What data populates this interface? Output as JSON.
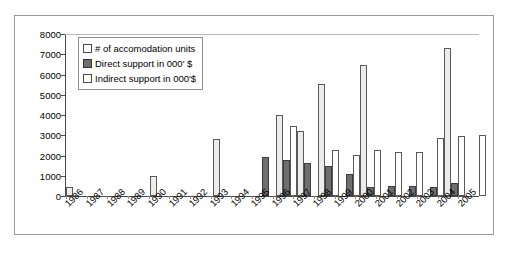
{
  "chart_data": {
    "type": "bar",
    "title": "",
    "xlabel": "",
    "ylabel": "",
    "ylim": [
      0,
      8000
    ],
    "yticks": [
      0,
      1000,
      2000,
      3000,
      4000,
      5000,
      6000,
      7000,
      8000
    ],
    "ytick_labels": [
      "0",
      "1000",
      "2000",
      "3000",
      "4000",
      "5000",
      "6000",
      "7000",
      "8000"
    ],
    "grid": "horizontal-top-only",
    "legend_position": "top-left-inside",
    "categories": [
      "1986",
      "1987",
      "1988",
      "1989",
      "1990",
      "1991",
      "1992",
      "1993",
      "1994",
      "1995",
      "1996",
      "1997",
      "1998",
      "1999",
      "2000",
      "2001",
      "2002",
      "2003",
      "2004",
      "2005"
    ],
    "series": [
      {
        "name": "# of accomodation units",
        "color": "#ECECEC",
        "values": [
          450,
          0,
          0,
          0,
          1000,
          0,
          0,
          2800,
          0,
          0,
          4000,
          3200,
          5550,
          0,
          6450,
          0,
          0,
          0,
          7300,
          0
        ]
      },
      {
        "name": "Direct support in 000' $",
        "color": "#6E6E6E",
        "values": [
          0,
          0,
          0,
          0,
          0,
          0,
          0,
          0,
          0,
          1950,
          1800,
          1650,
          1500,
          1100,
          450,
          500,
          500,
          430,
          650,
          0
        ]
      },
      {
        "name": "Indirect support in 000'$",
        "color": "#FFFFFF",
        "values": [
          0,
          0,
          0,
          0,
          0,
          0,
          0,
          0,
          0,
          0,
          3450,
          0,
          2250,
          2050,
          2250,
          2150,
          2150,
          2850,
          2950,
          3000
        ]
      }
    ]
  },
  "legend": {
    "items": [
      {
        "label": "# of accomodation units",
        "swatch": "s0"
      },
      {
        "label": "Direct support in 000' $",
        "swatch": "s1"
      },
      {
        "label": "Indirect support in 000'$",
        "swatch": "s2"
      }
    ]
  },
  "colors": {
    "series_light": "#ECECEC",
    "series_dark": "#6E6E6E",
    "series_white": "#FFFFFF",
    "axis": "#4A4A4A",
    "gridline": "#B9B9B9",
    "frame_border": "#9A9A9A"
  }
}
